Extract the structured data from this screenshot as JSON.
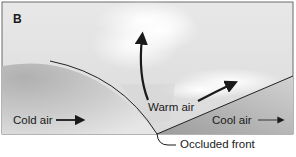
{
  "figure": {
    "panel_label": "B",
    "labels": {
      "cold_air": "Cold air",
      "warm_air": "Warm air",
      "cool_air": "Cool air",
      "occluded_front": "Occluded front"
    },
    "colors": {
      "border": "#6a6a6a",
      "sky": "#e4e4e4",
      "cold_air_mass": "#c8c8c8",
      "cool_air_mass": "#bdbdbd",
      "warm_air_region": "#dcdcdc",
      "cloud": "#f7f7f7",
      "arrows": "#1a1a1a"
    }
  }
}
